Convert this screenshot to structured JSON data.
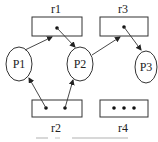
{
  "diagram": {
    "type": "resource-allocation-graph",
    "resources": [
      {
        "id": "r1",
        "label": "r1",
        "instances": 1
      },
      {
        "id": "r2",
        "label": "r2",
        "instances": 2
      },
      {
        "id": "r3",
        "label": "r3",
        "instances": 1
      },
      {
        "id": "r4",
        "label": "r4",
        "instances": 3
      }
    ],
    "processes": [
      {
        "id": "P1",
        "label": "P1"
      },
      {
        "id": "P2",
        "label": "P2"
      },
      {
        "id": "P3",
        "label": "P3"
      }
    ],
    "edges": [
      {
        "from": "P1",
        "to": "r1",
        "kind": "request"
      },
      {
        "from": "r1",
        "to": "P2",
        "kind": "assignment"
      },
      {
        "from": "P2",
        "to": "r3",
        "kind": "request"
      },
      {
        "from": "r3",
        "to": "P3",
        "kind": "assignment"
      },
      {
        "from": "r2",
        "to": "P1",
        "kind": "assignment"
      },
      {
        "from": "r2",
        "to": "P2",
        "kind": "assignment"
      }
    ],
    "caption": "",
    "colors": {
      "stroke": "#333333",
      "background": "#ffffff"
    }
  }
}
